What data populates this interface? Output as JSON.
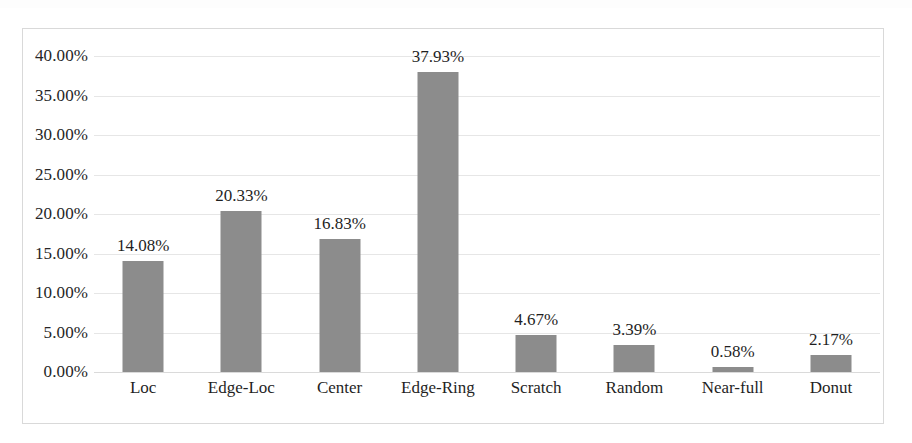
{
  "chart_data": {
    "type": "bar",
    "title": "",
    "subtitle": "",
    "xlabel": "",
    "ylabel": "",
    "categories": [
      "Loc",
      "Edge-Loc",
      "Center",
      "Edge-Ring",
      "Scratch",
      "Random",
      "Near-full",
      "Donut"
    ],
    "values": [
      14.08,
      20.33,
      16.83,
      37.93,
      4.67,
      3.39,
      0.58,
      2.17
    ],
    "value_labels": [
      "14.08%",
      "20.33%",
      "16.83%",
      "37.93%",
      "4.67%",
      "3.39%",
      "0.58%",
      "2.17%"
    ],
    "series": [
      {
        "name": "",
        "values": [
          14.08,
          20.33,
          16.83,
          37.93,
          4.67,
          3.39,
          0.58,
          2.17
        ]
      }
    ],
    "ylim": [
      0,
      40
    ],
    "ytick_values": [
      0,
      5,
      10,
      15,
      20,
      25,
      30,
      35,
      40
    ],
    "ytick_labels": [
      "0.00%",
      "5.00%",
      "10.00%",
      "15.00%",
      "20.00%",
      "25.00%",
      "30.00%",
      "35.00%",
      "40.00%"
    ],
    "grid": true,
    "grid_axis": "y",
    "legend": false,
    "legend_position": "none",
    "data_labels": true,
    "bar_color": "#8c8c8c",
    "gridline_color": "#e6e6e6",
    "frame_color": "#d9d9d9",
    "text_color": "#1f1f1f",
    "background_color": "#ffffff"
  }
}
